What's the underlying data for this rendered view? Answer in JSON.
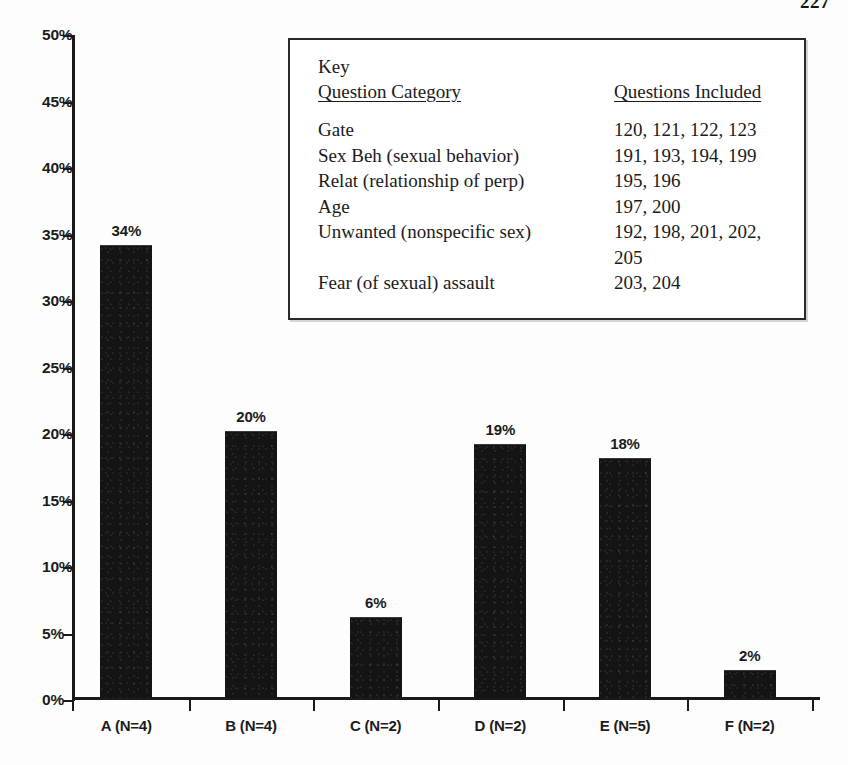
{
  "page": {
    "page_number": "227",
    "running_head": ""
  },
  "chart_data": {
    "type": "bar",
    "title": "",
    "xlabel": "",
    "ylabel": "",
    "categories": [
      "A (N=4)",
      "B (N=4)",
      "C (N=2)",
      "D (N=2)",
      "E (N=5)",
      "F (N=2)"
    ],
    "values": [
      34,
      20,
      6,
      19,
      18,
      2
    ],
    "value_labels": [
      "34%",
      "20%",
      "6%",
      "19%",
      "18%",
      "2%"
    ],
    "ylim": [
      0,
      50
    ],
    "y_ticks": [
      0,
      5,
      10,
      15,
      20,
      25,
      30,
      35,
      40,
      45,
      50
    ],
    "y_tick_labels": [
      "0%",
      "5%",
      "10%",
      "15%",
      "20%",
      "25%",
      "30%",
      "35%",
      "40%",
      "45%",
      "50%"
    ],
    "grid": false,
    "legend_position": "inside-top-right",
    "bar_color": "#141414"
  },
  "key": {
    "title": "Key",
    "header": {
      "category": "Question Category",
      "questions": "Questions Included"
    },
    "rows": [
      {
        "category": "Gate",
        "questions": "120, 121, 122, 123"
      },
      {
        "category": "Sex Beh (sexual behavior)",
        "questions": "191, 193, 194, 199"
      },
      {
        "category": "Relat (relationship of perp)",
        "questions": "195, 196"
      },
      {
        "category": "Age",
        "questions": "197, 200"
      },
      {
        "category": "Unwanted (nonspecific sex)",
        "questions": "192, 198, 201, 202, 205"
      },
      {
        "category": "Fear (of sexual) assault",
        "questions": "203, 204"
      }
    ]
  }
}
